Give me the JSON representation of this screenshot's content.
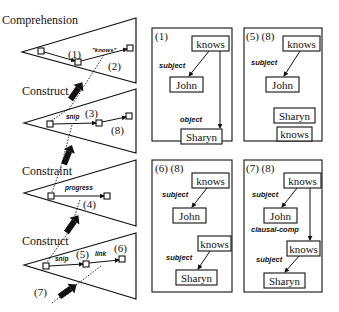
{
  "stages": [
    {
      "label": "Comprehension",
      "tri": {
        "tip": [
          22,
          52
        ],
        "top": [
          136,
          18
        ],
        "bottom": [
          136,
          83
        ]
      },
      "nodes": [
        [
          41,
          51
        ],
        [
          78,
          62
        ],
        [
          130,
          48
        ]
      ],
      "texts": [
        {
          "t": "(1)",
          "x": 68,
          "y": 58
        },
        {
          "t": "\"knows\"",
          "x": 93,
          "y": 52,
          "cls": "it-small"
        },
        {
          "t": "(2)",
          "x": 108,
          "y": 69
        }
      ]
    },
    {
      "label": "Construct",
      "tri": {
        "tip": [
          24,
          123
        ],
        "top": [
          136,
          89
        ],
        "bottom": [
          136,
          153
        ]
      },
      "nodes": [
        [
          50,
          124
        ],
        [
          99,
          123
        ],
        [
          129,
          116
        ]
      ],
      "texts": [
        {
          "t": "snip",
          "x": 67,
          "y": 120,
          "cls": "it-small"
        },
        {
          "t": "(3)",
          "x": 85,
          "y": 117
        },
        {
          "t": "(8)",
          "x": 111,
          "y": 133
        }
      ]
    },
    {
      "label": "Constraint",
      "tri": {
        "tip": [
          24,
          193
        ],
        "top": [
          136,
          160
        ],
        "bottom": [
          136,
          226
        ]
      },
      "nodes": [
        [
          51,
          196
        ],
        [
          107,
          196
        ]
      ],
      "texts": [
        {
          "t": "progress",
          "x": 66,
          "y": 189,
          "cls": "it-small"
        },
        {
          "t": "(4)",
          "x": 83,
          "y": 208
        }
      ]
    },
    {
      "label": "Construct",
      "tri": {
        "tip": [
          24,
          265
        ],
        "top": [
          136,
          233
        ],
        "bottom": [
          136,
          299
        ]
      },
      "nodes": [
        [
          46,
          266
        ],
        [
          86,
          264
        ],
        [
          122,
          259
        ]
      ],
      "texts": [
        {
          "t": "snip",
          "x": 55,
          "y": 261,
          "cls": "it-small"
        },
        {
          "t": "(5)",
          "x": 76,
          "y": 258
        },
        {
          "t": "link",
          "x": 95,
          "y": 256,
          "cls": "it-small"
        },
        {
          "t": "(6)",
          "x": 114,
          "y": 252
        },
        {
          "t": "(7)",
          "x": 34,
          "y": 295
        }
      ]
    }
  ],
  "panels": [
    {
      "id": "p1",
      "label": "(1)",
      "x": 152,
      "y": 28,
      "w": 80,
      "h": 113,
      "boxes": [
        {
          "t": "knows",
          "x": 192,
          "y": 36,
          "w": 37,
          "h": 15
        },
        {
          "t": "John",
          "x": 170,
          "y": 77,
          "w": 33,
          "h": 15
        },
        {
          "t": "Sharyn",
          "x": 181,
          "y": 129,
          "w": 41,
          "h": 15
        }
      ],
      "edges": [
        [
          211,
          51,
          186,
          77
        ],
        [
          222,
          51,
          222,
          128
        ]
      ],
      "labels": [
        {
          "t": "subject",
          "x": 160,
          "y": 68
        },
        {
          "t": "object",
          "x": 181,
          "y": 121
        }
      ]
    },
    {
      "id": "p2",
      "label": "(5) (8)",
      "x": 244,
      "y": 28,
      "w": 78,
      "h": 113,
      "boxes": [
        {
          "t": "knows",
          "x": 283,
          "y": 36,
          "w": 37,
          "h": 15
        },
        {
          "t": "John",
          "x": 266,
          "y": 77,
          "w": 33,
          "h": 15
        },
        {
          "t": "Sharyn",
          "x": 274,
          "y": 108,
          "w": 41,
          "h": 15
        },
        {
          "t": "knows",
          "x": 277,
          "y": 128,
          "w": 35,
          "h": 13
        }
      ],
      "edges": [
        [
          300,
          51,
          282,
          77
        ]
      ],
      "labels": [
        {
          "t": "subject",
          "x": 252,
          "y": 65
        }
      ]
    },
    {
      "id": "p3",
      "label": "(6) (8)",
      "x": 152,
      "y": 160,
      "w": 80,
      "h": 132,
      "boxes": [
        {
          "t": "knows",
          "x": 192,
          "y": 173,
          "w": 37,
          "h": 15
        },
        {
          "t": "John",
          "x": 173,
          "y": 208,
          "w": 33,
          "h": 15
        },
        {
          "t": "knows",
          "x": 198,
          "y": 236,
          "w": 33,
          "h": 15
        },
        {
          "t": "Sharyn",
          "x": 176,
          "y": 270,
          "w": 41,
          "h": 15
        }
      ],
      "edges": [
        [
          207,
          188,
          190,
          208
        ],
        [
          210,
          251,
          197,
          270
        ]
      ],
      "labels": [
        {
          "t": "subject",
          "x": 162,
          "y": 196
        },
        {
          "t": "subject",
          "x": 166,
          "y": 258
        }
      ]
    },
    {
      "id": "p4",
      "label": "(7) (8)",
      "x": 244,
      "y": 160,
      "w": 78,
      "h": 132,
      "boxes": [
        {
          "t": "knows",
          "x": 284,
          "y": 173,
          "w": 37,
          "h": 15
        },
        {
          "t": "John",
          "x": 264,
          "y": 208,
          "w": 33,
          "h": 15
        },
        {
          "t": "knows",
          "x": 287,
          "y": 241,
          "w": 33,
          "h": 15
        },
        {
          "t": "Sharyn",
          "x": 264,
          "y": 273,
          "w": 41,
          "h": 15
        }
      ],
      "edges": [
        [
          298,
          188,
          280,
          208
        ],
        [
          310,
          188,
          310,
          241
        ],
        [
          300,
          256,
          283,
          273
        ]
      ],
      "labels": [
        {
          "t": "subject",
          "x": 252,
          "y": 196
        },
        {
          "t": "clausal-comp",
          "x": 251,
          "y": 231
        },
        {
          "t": "subject",
          "x": 256,
          "y": 261
        }
      ]
    }
  ]
}
